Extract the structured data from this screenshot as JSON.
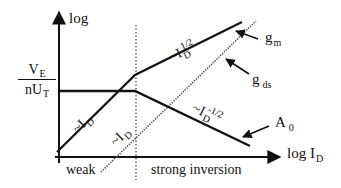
{
  "diagram": {
    "y_axis": {
      "label": "log"
    },
    "x_axis": {
      "label_main": "log I",
      "label_sub": "D"
    },
    "y_tick": {
      "numerator_main": "V",
      "numerator_sub": "E",
      "denominator_main": "nU",
      "denominator_sub": "T"
    },
    "regions": {
      "left": "weak",
      "right": "strong inversion"
    },
    "curves": {
      "gm": {
        "label_main": "g",
        "label_sub": "m"
      },
      "gds": {
        "label_main": "g",
        "label_sub": "ds"
      },
      "a0": {
        "label_main": "A",
        "label_sub": "0"
      }
    },
    "slope_labels": {
      "gm_weak": {
        "prefix": "~I",
        "sub": "D",
        "sup": ""
      },
      "gm_strong": {
        "prefix": "~I",
        "sub": "D",
        "sup": "1/2"
      },
      "gds": {
        "prefix": "~I",
        "sub": "D",
        "sup": ""
      },
      "a0_strong": {
        "prefix": "~I",
        "sub": "D",
        "sup": "-1/2"
      }
    },
    "colors": {
      "line": "#111111",
      "dotted": "#555555",
      "background": "#ffffff"
    }
  }
}
